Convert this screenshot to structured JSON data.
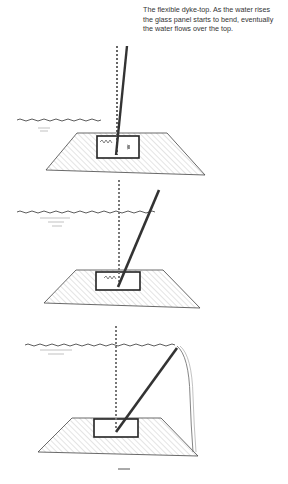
{
  "caption": {
    "lines": [
      "The flexible dyke-top. As the water rises",
      "the glass panel starts to bend, eventually",
      "the water flows over the top."
    ]
  },
  "illustration": {
    "panels": [
      {
        "stage": "low-water",
        "description": "Water low; glass panel slightly tilted in dyke-top housing"
      },
      {
        "stage": "rising-water",
        "description": "Water rising; glass panel bending further"
      },
      {
        "stage": "overflow",
        "description": "Water at top; panel bent fully, water flows over the top"
      }
    ],
    "colors": {
      "ink": "#222222",
      "shade": "#bbbbbb"
    }
  }
}
